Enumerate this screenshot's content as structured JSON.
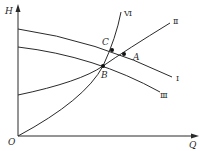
{
  "diagram": {
    "type": "pump-system characteristic curves",
    "axes": {
      "y_label": "H",
      "x_label": "Q",
      "origin_label": "O"
    },
    "curves": [
      {
        "id": "I",
        "label": "Ⅰ",
        "description": "pump head curve (upper)"
      },
      {
        "id": "II",
        "label": "Ⅱ",
        "description": "system curve with static head"
      },
      {
        "id": "III",
        "label": "Ⅲ",
        "description": "pump head curve (lower)"
      },
      {
        "id": "VI",
        "label": "Ⅵ",
        "description": "system curve through origin"
      }
    ],
    "points": [
      {
        "id": "A",
        "label": "A",
        "on": [
          "I",
          "II"
        ]
      },
      {
        "id": "B",
        "label": "B",
        "on": [
          "II",
          "III",
          "VI"
        ]
      },
      {
        "id": "C",
        "label": "C",
        "on": [
          "I",
          "VI"
        ]
      }
    ],
    "colors": {
      "line": "#2a2a2a",
      "background": "#ffffff"
    }
  }
}
